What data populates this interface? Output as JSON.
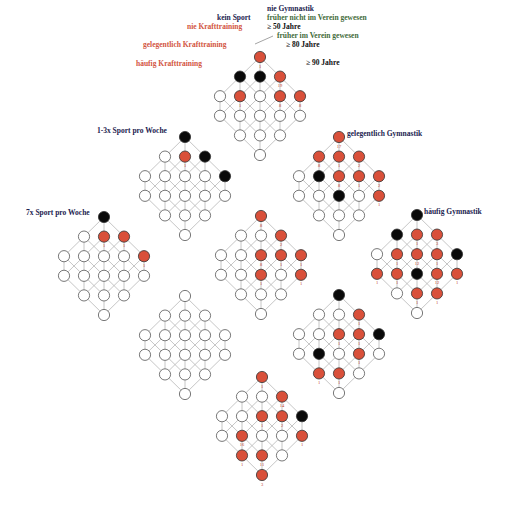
{
  "colors": {
    "red_node": "#d9503a",
    "black_node": "#0a0a0a",
    "white_node": "#ffffff",
    "node_stroke": "#555555",
    "edge": "#b8b8b8",
    "number": "#c0392b"
  },
  "layout": {
    "dx": 20,
    "dy": 19.6,
    "radius": 5.6
  },
  "lattice_shape": [
    [
      0
    ],
    [
      -1,
      0,
      1
    ],
    [
      -2,
      -1,
      0,
      1,
      2
    ],
    [
      -2,
      -1,
      0,
      1,
      2
    ],
    [
      -1,
      0,
      1
    ],
    [
      0
    ]
  ],
  "labels": [
    {
      "id": "kein-sport",
      "text": "kein Sport",
      "x": 217,
      "y": 14,
      "color": "navy"
    },
    {
      "id": "nie-krafttraining",
      "text": "nie Krafttraining",
      "x": 187,
      "y": 23,
      "color": "red"
    },
    {
      "id": "nie-gymnastik",
      "text": "nie Gymnastik",
      "x": 267,
      "y": 5,
      "color": "navy"
    },
    {
      "id": "frueher-nicht-verein",
      "text": "früher nicht im Verein gewesen",
      "x": 267,
      "y": 14,
      "color": "green"
    },
    {
      "id": "ge-50-jahre",
      "text": "≥ 50 Jahre",
      "x": 267,
      "y": 23,
      "color": "black"
    },
    {
      "id": "frueher-verein",
      "text": "früher im Verein gewesen",
      "x": 277,
      "y": 32,
      "color": "green"
    },
    {
      "id": "gelegentlich-krafttraining",
      "text": "gelegentlich Krafttraining",
      "x": 143,
      "y": 41,
      "color": "red"
    },
    {
      "id": "ge-80-jahre",
      "text": "≥ 80 Jahre",
      "x": 286,
      "y": 41,
      "color": "black"
    },
    {
      "id": "haeufig-krafttraining",
      "text": "häufig Krafttraining",
      "x": 136,
      "y": 60,
      "color": "red"
    },
    {
      "id": "ge-90-jahre",
      "text": "≥ 90 Jahre",
      "x": 306,
      "y": 59,
      "color": "black"
    },
    {
      "id": "sport-1-3x",
      "text": "1-3x Sport pro Woche",
      "x": 97,
      "y": 127,
      "color": "navy"
    },
    {
      "id": "gelegentlich-gymnastik",
      "text": "gelegentlich Gymnastik",
      "x": 347,
      "y": 130,
      "color": "navy"
    },
    {
      "id": "sport-7x",
      "text": "7x Sport pro Woche",
      "x": 26,
      "y": 209,
      "color": "navy"
    },
    {
      "id": "haeufig-gymnastik",
      "text": "häufig Gymnastik",
      "x": 424,
      "y": 208,
      "color": "navy"
    }
  ],
  "lattices": [
    {
      "id": "top",
      "x": 260,
      "y": 57,
      "states": [
        [
          "r"
        ],
        [
          "b",
          "b",
          "r"
        ],
        [
          "w",
          "r",
          "w",
          "r",
          "r"
        ],
        [
          "w",
          "w",
          "w",
          "w",
          "w"
        ],
        [
          "w",
          "w",
          "w"
        ],
        [
          "w"
        ]
      ],
      "numbers": [
        [
          0,
          0,
          "1"
        ],
        [
          1,
          2,
          "19"
        ],
        [
          2,
          1,
          "1"
        ],
        [
          2,
          3,
          "8"
        ],
        [
          2,
          4,
          "8"
        ]
      ]
    },
    {
      "id": "sport-1-3x",
      "x": 185,
      "y": 137,
      "states": [
        [
          "b"
        ],
        [
          "w",
          "r",
          "b"
        ],
        [
          "w",
          "w",
          "w",
          "w",
          "b"
        ],
        [
          "w",
          "w",
          "w",
          "w",
          "w"
        ],
        [
          "w",
          "w",
          "w"
        ],
        [
          "w"
        ]
      ],
      "numbers": [
        [
          1,
          1,
          "1"
        ]
      ]
    },
    {
      "id": "gelegentlich-gymnastik",
      "x": 339,
      "y": 137,
      "states": [
        [
          "r"
        ],
        [
          "r",
          "r",
          "r"
        ],
        [
          "w",
          "b",
          "r",
          "r",
          "r"
        ],
        [
          "w",
          "w",
          "b",
          "w",
          "r"
        ],
        [
          "w",
          "w",
          "w"
        ],
        [
          "w"
        ]
      ],
      "numbers": [
        [
          0,
          0,
          "17"
        ],
        [
          1,
          0,
          "8"
        ],
        [
          1,
          1,
          "1"
        ],
        [
          1,
          2,
          "2"
        ],
        [
          2,
          2,
          "8"
        ],
        [
          2,
          3,
          "1"
        ],
        [
          2,
          4,
          "2"
        ],
        [
          3,
          4,
          "1"
        ]
      ]
    },
    {
      "id": "sport-7x",
      "x": 104,
      "y": 217,
      "states": [
        [
          "b"
        ],
        [
          "w",
          "r",
          "r"
        ],
        [
          "w",
          "w",
          "w",
          "w",
          "r"
        ],
        [
          "w",
          "w",
          "w",
          "w",
          "w"
        ],
        [
          "w",
          "w",
          "w"
        ],
        [
          "w"
        ]
      ],
      "numbers": [
        [
          1,
          1,
          "1"
        ],
        [
          1,
          2,
          "1"
        ],
        [
          2,
          4,
          "1"
        ]
      ]
    },
    {
      "id": "center",
      "x": 261,
      "y": 216,
      "states": [
        [
          "r"
        ],
        [
          "w",
          "w",
          "r"
        ],
        [
          "w",
          "w",
          "r",
          "r",
          "r"
        ],
        [
          "w",
          "w",
          "r",
          "w",
          "r"
        ],
        [
          "w",
          "w",
          "w"
        ],
        [
          "w"
        ]
      ],
      "numbers": [
        [
          0,
          0,
          "8"
        ],
        [
          1,
          2,
          "2"
        ],
        [
          2,
          2,
          "8"
        ],
        [
          2,
          3,
          "1"
        ],
        [
          2,
          4,
          "1"
        ],
        [
          3,
          2,
          "1"
        ],
        [
          3,
          4,
          "1"
        ]
      ]
    },
    {
      "id": "haeufig-gymnastik",
      "x": 417,
      "y": 215,
      "states": [
        [
          "b"
        ],
        [
          "b",
          "r",
          "r"
        ],
        [
          "w",
          "r",
          "r",
          "r",
          "b"
        ],
        [
          "r",
          "r",
          "b",
          "r",
          "r"
        ],
        [
          "w",
          "r",
          "r"
        ],
        [
          "w"
        ]
      ],
      "numbers": [
        [
          1,
          1,
          "1"
        ],
        [
          1,
          2,
          "3"
        ],
        [
          2,
          1,
          "1"
        ],
        [
          2,
          2,
          "12"
        ],
        [
          2,
          3,
          "1"
        ],
        [
          3,
          0,
          "1"
        ],
        [
          3,
          1,
          "1"
        ],
        [
          3,
          3,
          "12"
        ],
        [
          3,
          4,
          "1"
        ],
        [
          4,
          1,
          "1"
        ],
        [
          4,
          2,
          "1"
        ]
      ]
    },
    {
      "id": "lower-left",
      "x": 185,
      "y": 296,
      "states": [
        [
          "w"
        ],
        [
          "w",
          "w",
          "w"
        ],
        [
          "w",
          "w",
          "w",
          "w",
          "w"
        ],
        [
          "w",
          "w",
          "w",
          "w",
          "w"
        ],
        [
          "w",
          "w",
          "w"
        ],
        [
          "w"
        ]
      ],
      "numbers": []
    },
    {
      "id": "lower-right",
      "x": 339,
      "y": 295,
      "states": [
        [
          "b"
        ],
        [
          "w",
          "w",
          "r"
        ],
        [
          "w",
          "w",
          "r",
          "r",
          "b"
        ],
        [
          "w",
          "b",
          "w",
          "r",
          "w"
        ],
        [
          "r",
          "r",
          "w"
        ],
        [
          "w"
        ]
      ],
      "numbers": [
        [
          1,
          2,
          "1"
        ],
        [
          2,
          2,
          "1"
        ],
        [
          2,
          3,
          "1"
        ],
        [
          3,
          3,
          "1"
        ],
        [
          4,
          0,
          "1"
        ],
        [
          4,
          1,
          "1"
        ]
      ]
    },
    {
      "id": "bottom",
      "x": 262,
      "y": 377,
      "states": [
        [
          "r"
        ],
        [
          "w",
          "w",
          "r"
        ],
        [
          "w",
          "w",
          "r",
          "r",
          "b"
        ],
        [
          "w",
          "r",
          "w",
          "w",
          "r"
        ],
        [
          "r",
          "r",
          "w"
        ],
        [
          "r"
        ]
      ],
      "numbers": [
        [
          0,
          0,
          "1"
        ],
        [
          1,
          2,
          "14"
        ],
        [
          2,
          2,
          "1"
        ],
        [
          2,
          3,
          "2"
        ],
        [
          3,
          1,
          "16"
        ],
        [
          3,
          4,
          "1"
        ],
        [
          4,
          0,
          "1"
        ],
        [
          4,
          1,
          "11"
        ],
        [
          5,
          0,
          "3"
        ]
      ]
    }
  ]
}
